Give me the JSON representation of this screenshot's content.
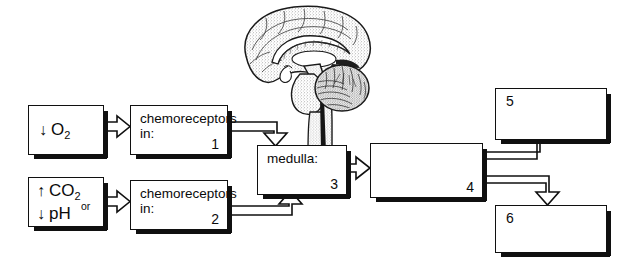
{
  "diagram": {
    "type": "flowchart",
    "background_color": "#ffffff",
    "line_color": "#101010"
  },
  "stimuli": [
    {
      "id": "stimulus-o2",
      "arrow": "↓",
      "analyte": "O",
      "subscript": "2",
      "connector": "",
      "second_arrow": "",
      "second_analyte": "",
      "second_subscript": ""
    },
    {
      "id": "stimulus-co2-ph",
      "arrow": "↑",
      "analyte": "CO",
      "subscript": "2",
      "connector": "or",
      "second_arrow": "↓",
      "second_analyte": "pH",
      "second_subscript": ""
    }
  ],
  "boxes": [
    {
      "id": "box-1",
      "label": "chemoreceptors\nin:",
      "number": "1",
      "number_position": "bottom-right"
    },
    {
      "id": "box-2",
      "label": "chemoreceptors\nin:",
      "number": "2",
      "number_position": "bottom-right"
    },
    {
      "id": "box-3",
      "label": "medulla:",
      "number": "3",
      "number_position": "bottom-right"
    },
    {
      "id": "box-4",
      "label": "",
      "number": "4",
      "number_position": "bottom-right"
    },
    {
      "id": "box-5",
      "label": "",
      "number": "5",
      "number_position": "top-left"
    },
    {
      "id": "box-6",
      "label": "",
      "number": "6",
      "number_position": "top-left"
    }
  ],
  "illustration": {
    "name": "brain-midsagittal-illustration",
    "parts": [
      "cerebrum",
      "corpus callosum",
      "brainstem",
      "cerebellum",
      "medulla oblongata"
    ],
    "style": "stippled line drawing"
  },
  "arrows": [
    {
      "name": "arrow-o2-to-box1",
      "kind": "block-arrow",
      "direction": "right"
    },
    {
      "name": "arrow-co2-to-box2",
      "kind": "block-arrow",
      "direction": "right"
    },
    {
      "name": "arrow-box1-to-medulla",
      "kind": "elbow-pipe-arrow",
      "direction": "right-then-down"
    },
    {
      "name": "arrow-box2-to-medulla",
      "kind": "elbow-pipe-arrow",
      "direction": "right-then-up"
    },
    {
      "name": "arrow-medulla-to-box4",
      "kind": "block-arrow",
      "direction": "right"
    },
    {
      "name": "arrow-box4-to-box5",
      "kind": "elbow-pipe-arrow",
      "direction": "right-then-up"
    },
    {
      "name": "arrow-box4-to-box6",
      "kind": "elbow-pipe-arrow",
      "direction": "right-then-down"
    }
  ]
}
